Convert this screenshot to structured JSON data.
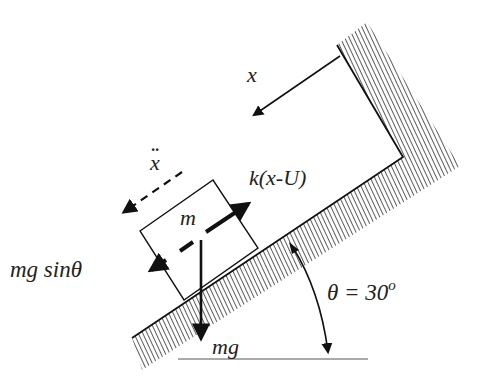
{
  "diagram": {
    "type": "free-body diagram",
    "labels": {
      "x_displacement": "x",
      "x_accel_dots": "··",
      "x_accel": "x",
      "spring_force": "k(x-U)",
      "mass": "m",
      "gravity_component": "mg sinθ",
      "weight": "mg",
      "angle": "θ = 30",
      "angle_degree": "o"
    },
    "colors": {
      "ink": "#222222",
      "background": "#ffffff"
    },
    "incline_angle_deg": 30
  }
}
